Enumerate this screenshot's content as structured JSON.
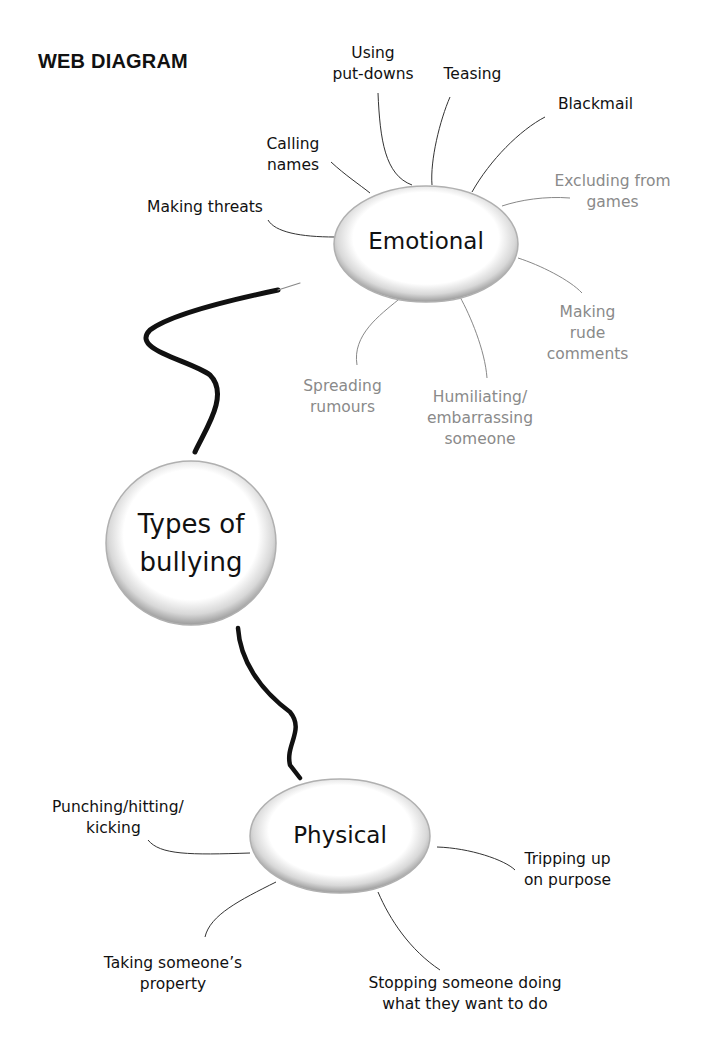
{
  "title": "WEB DIAGRAM",
  "central_node": {
    "label_line1": "Types of",
    "label_line2": "bullying"
  },
  "branches": {
    "emotional": {
      "label": "Emotional",
      "items": [
        {
          "line1": "Using",
          "line2": "put-downs",
          "color": "#111111"
        },
        {
          "line1": "Teasing",
          "color": "#111111"
        },
        {
          "line1": "Blackmail",
          "color": "#111111"
        },
        {
          "line1": "Calling",
          "line2": "names",
          "color": "#111111"
        },
        {
          "line1": "Making threats",
          "color": "#111111"
        },
        {
          "line1": "Excluding from",
          "line2": "games",
          "color": "#8a8a8a"
        },
        {
          "line1": "Making",
          "line2": "rude",
          "line3": "comments",
          "color": "#8a8a8a"
        },
        {
          "line1": "Spreading",
          "line2": "rumours",
          "color": "#8a8a8a"
        },
        {
          "line1": "Humiliating/",
          "line2": "embarrassing",
          "line3": "someone",
          "color": "#8a8a8a"
        }
      ]
    },
    "physical": {
      "label": "Physical",
      "items": [
        {
          "line1": "Punching/hitting/",
          "line2": "kicking",
          "color": "#111111"
        },
        {
          "line1": "Tripping up",
          "line2": "on purpose",
          "color": "#111111"
        },
        {
          "line1": "Taking someone’s",
          "line2": "property",
          "color": "#111111"
        },
        {
          "line1": "Stopping someone doing",
          "line2": "what they want to do",
          "color": "#111111"
        }
      ]
    }
  }
}
